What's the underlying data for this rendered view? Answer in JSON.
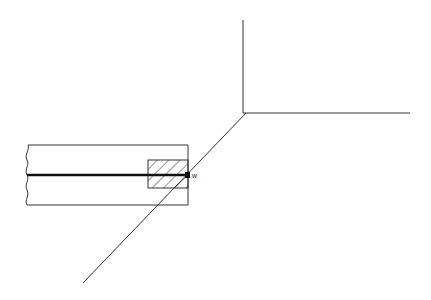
{
  "diagram": {
    "labels": {
      "w": "w"
    },
    "colors": {
      "line": "#333333",
      "rod": "#111111",
      "background": "#ffffff"
    }
  }
}
